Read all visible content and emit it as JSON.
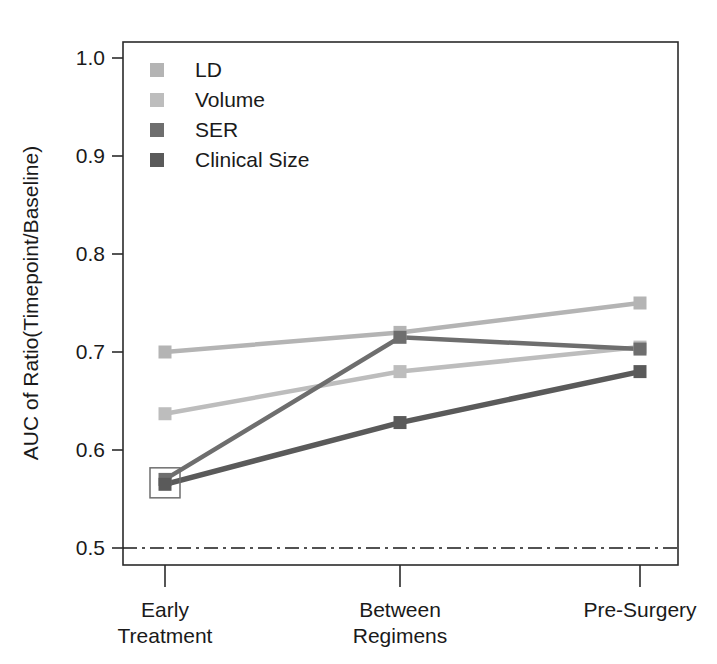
{
  "chart_data": {
    "type": "line",
    "title": "",
    "xlabel": "",
    "ylabel": "AUC of Ratio(Timepoint/Baseline)",
    "categories": [
      "Early\nTreatment",
      "Between\nRegimens",
      "Pre-Surgery"
    ],
    "category_lines": [
      [
        "Early",
        "Treatment"
      ],
      [
        "Between",
        "Regimens"
      ],
      [
        "Pre-Surgery"
      ]
    ],
    "ylim": [
      0.47,
      1.03
    ],
    "yticks": [
      0.5,
      0.6,
      0.7,
      0.8,
      0.9,
      1.0
    ],
    "ytick_labels": [
      "0.5",
      "0.6",
      "0.7",
      "0.8",
      "0.9",
      "1.0"
    ],
    "grid": false,
    "legend_position": "top-left-inside",
    "marker": "square",
    "reference_line": {
      "y": 0.5,
      "style": "dash-dot",
      "color": "#1a1a1a",
      "label": ""
    },
    "annotations": [
      {
        "type": "open-square-highlight",
        "category": "Early\nTreatment",
        "y": 0.5665,
        "note": "open square outline around overlapping SER and Clinical Size markers"
      }
    ],
    "series": [
      {
        "name": "LD",
        "color": "#b4b4b4",
        "values": [
          0.7,
          0.72,
          0.75
        ]
      },
      {
        "name": "Volume",
        "color": "#bdbdbd",
        "values": [
          0.637,
          0.68,
          0.705
        ]
      },
      {
        "name": "SER",
        "color": "#6e6e6e",
        "values": [
          0.57,
          0.715,
          0.703
        ]
      },
      {
        "name": "Clinical Size",
        "color": "#5a5a5a",
        "values": [
          0.565,
          0.628,
          0.68
        ]
      }
    ]
  },
  "legend": {
    "entries": [
      {
        "label": "LD",
        "color": "#b4b4b4"
      },
      {
        "label": "Volume",
        "color": "#bdbdbd"
      },
      {
        "label": "SER",
        "color": "#6e6e6e"
      },
      {
        "label": "Clinical Size",
        "color": "#5a5a5a"
      }
    ]
  },
  "colors": {
    "axis": "#2b2b2b",
    "text": "#1a1a1a",
    "background": "#ffffff",
    "reference": "#1a1a1a",
    "highlight_box": "#6e6e6e"
  }
}
